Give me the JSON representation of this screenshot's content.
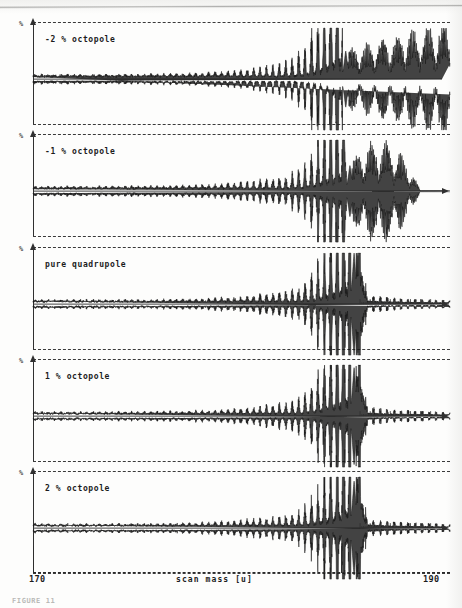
{
  "figure": {
    "caption": "FIGURE 11",
    "axis": {
      "x_title": "scan mass  [u]",
      "x_tick_labels": [
        "170",
        "190"
      ],
      "x_min": 170,
      "x_max": 190,
      "y_label": "%"
    },
    "panels": [
      {
        "id": "panel-octopole-minus2",
        "label": "-2 % octopole",
        "octopole_percent": -2
      },
      {
        "id": "panel-octopole-minus1",
        "label": "-1 % octopole",
        "octopole_percent": -1
      },
      {
        "id": "panel-pure-quadrupole",
        "label": "pure quadrupole",
        "octopole_percent": 0
      },
      {
        "id": "panel-octopole-plus1",
        "label": "1 % octopole",
        "octopole_percent": 1
      },
      {
        "id": "panel-octopole-plus2",
        "label": "2 % octopole",
        "octopole_percent": 2
      }
    ]
  },
  "chart_data": {
    "type": "line",
    "title": "",
    "xlabel": "scan mass  [u]",
    "ylabel": "%",
    "xlim": [
      170,
      190
    ],
    "x_ticks": [
      170,
      190
    ],
    "grid": false,
    "legend": "none",
    "series": [
      {
        "name": "-2 % octopole",
        "panel": 0,
        "baseline_ripple_amplitude": 0.06,
        "main_peak_x": 185.0,
        "main_peak_amplitude": 0.55,
        "tail": "strong growing beat envelope after the main peak, reaching full panel height at 190 u",
        "tail_envelope_x": [
          185.0,
          185.8,
          186.6,
          187.4,
          188.2,
          189.0,
          190.0
        ],
        "tail_envelope_y": [
          0.55,
          0.62,
          0.74,
          0.82,
          0.9,
          0.96,
          1.0
        ]
      },
      {
        "name": "-1 % octopole",
        "panel": 1,
        "baseline_ripple_amplitude": 0.06,
        "main_peak_x": 185.2,
        "main_peak_amplitude": 0.5,
        "tail": "moderate beat envelope after the main peak, decaying to zero near 188.6 u",
        "tail_envelope_x": [
          185.2,
          185.8,
          186.4,
          187.0,
          187.6,
          188.2,
          188.6
        ],
        "tail_envelope_y": [
          0.5,
          0.78,
          0.92,
          0.88,
          0.7,
          0.34,
          0.0
        ]
      },
      {
        "name": "pure quadrupole",
        "panel": 2,
        "baseline_ripple_amplitude": 0.055,
        "main_peak_x": 185.4,
        "main_peak_amplitude": 1.0,
        "tail": "single sharp spike at the mass edge, followed by a flat baseline with small regular tick ripples",
        "tail_envelope_x": [
          185.4,
          186.0,
          187.0,
          188.0,
          189.0,
          190.0
        ],
        "tail_envelope_y": [
          1.0,
          0.05,
          0.035,
          0.03,
          0.025,
          0.02
        ]
      },
      {
        "name": "1 % octopole",
        "panel": 3,
        "baseline_ripple_amplitude": 0.055,
        "main_peak_x": 185.4,
        "main_peak_amplitude": 0.95,
        "tail": "single sharp spike at the mass edge, flat baseline with small ripples afterwards",
        "tail_envelope_x": [
          185.4,
          186.0,
          187.0,
          188.0,
          189.0,
          190.0
        ],
        "tail_envelope_y": [
          0.95,
          0.05,
          0.035,
          0.03,
          0.025,
          0.02
        ]
      },
      {
        "name": "2 % octopole",
        "panel": 4,
        "baseline_ripple_amplitude": 0.055,
        "main_peak_x": 185.4,
        "main_peak_amplitude": 0.92,
        "tail": "single sharp spike at the mass edge, flat baseline with small ripples afterwards",
        "tail_envelope_x": [
          185.4,
          186.0,
          187.0,
          188.0,
          189.0,
          190.0
        ],
        "tail_envelope_y": [
          0.92,
          0.05,
          0.035,
          0.03,
          0.025,
          0.02
        ]
      }
    ]
  }
}
